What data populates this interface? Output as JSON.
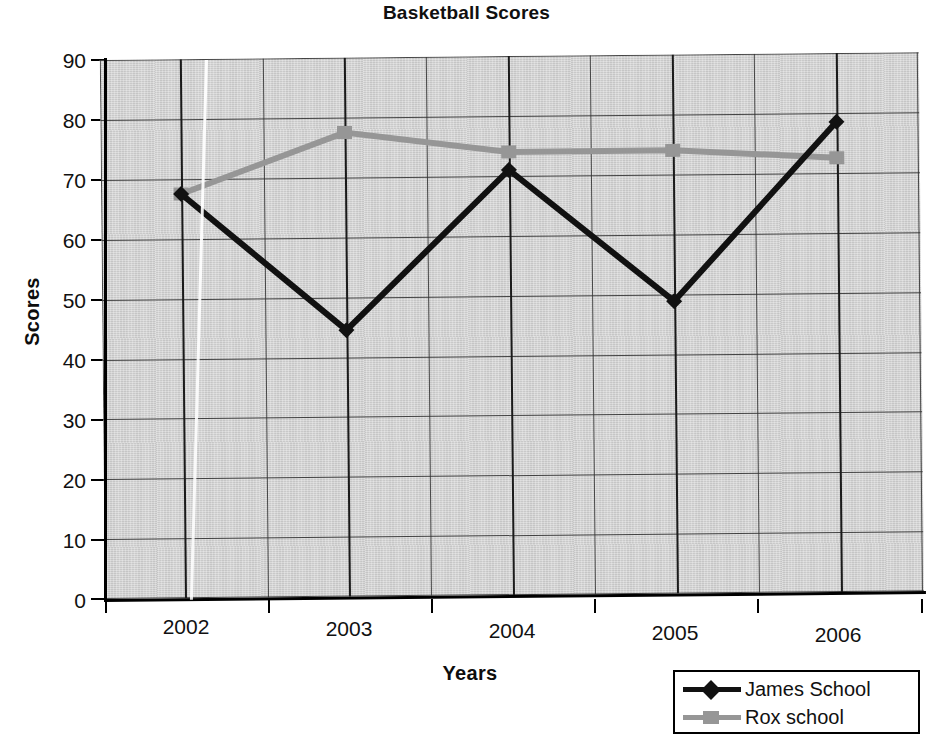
{
  "chart_data": {
    "type": "line",
    "title": "Basketball Scores",
    "xlabel": "Years",
    "ylabel": "Scores",
    "categories": [
      "2002",
      "2003",
      "2004",
      "2005",
      "2006"
    ],
    "ylim": [
      0,
      90
    ],
    "ytick_step": 10,
    "yticks": [
      "90",
      "80",
      "70",
      "60",
      "50",
      "40",
      "30",
      "20",
      "10",
      "0"
    ],
    "grid": "both",
    "legend_position": "bottom-right",
    "series": [
      {
        "name": "James School",
        "color": "#111111",
        "marker": "diamond",
        "values": [
          67.5,
          44.5,
          71,
          48.8,
          78.5
        ]
      },
      {
        "name": "Rox school",
        "color": "#969696",
        "marker": "square",
        "values": [
          67.5,
          77.5,
          74,
          74,
          72.5
        ]
      }
    ]
  },
  "legend": {
    "entries": [
      {
        "label": "James School"
      },
      {
        "label": "Rox school"
      }
    ]
  }
}
